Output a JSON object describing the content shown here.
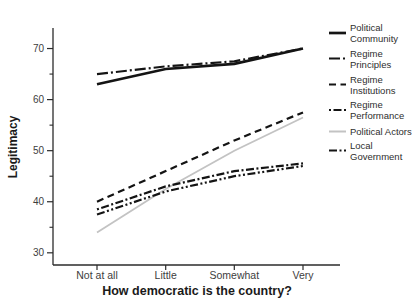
{
  "chart_data": {
    "type": "line",
    "title": "",
    "xlabel": "How democratic is the country?",
    "ylabel": "Legitimacy",
    "categories": [
      "Not at all",
      "Little",
      "Somewhat",
      "Very"
    ],
    "ylim": [
      27.5,
      75
    ],
    "yticks_major": [
      30,
      40,
      50,
      60,
      70
    ],
    "yticks_minor": [
      35,
      45,
      55,
      65,
      75
    ],
    "grid": false,
    "legend_position": "right",
    "axis_color": "#2b2b2b",
    "tick_label_color": "#3d3d3d",
    "legend_text_color": "#2e2e2e",
    "series": [
      {
        "name": "Political Community",
        "label_lines": [
          "Political",
          "Community"
        ],
        "values": [
          63,
          66,
          67,
          70
        ],
        "color": "#141414",
        "dash": "",
        "width": 2.7
      },
      {
        "name": "Regime Principles",
        "label_lines": [
          "Regime",
          "Principles"
        ],
        "values": [
          65,
          66.5,
          67.5,
          70
        ],
        "color": "#141414",
        "dash": "11 3 2 3",
        "width": 2.2
      },
      {
        "name": "Regime Institutions",
        "label_lines": [
          "Regime",
          "Institutions"
        ],
        "values": [
          40,
          46,
          52,
          57.5
        ],
        "color": "#141414",
        "dash": "7 4.5",
        "width": 2.2
      },
      {
        "name": "Regime Performance",
        "label_lines": [
          "Regime",
          "Performance"
        ],
        "values": [
          38.5,
          43,
          46,
          47.5
        ],
        "color": "#141414",
        "dash": "2 2.5 8 2.5",
        "width": 2.2
      },
      {
        "name": "Political Actors",
        "label_lines": [
          "Political Actors"
        ],
        "values": [
          34,
          42.5,
          50,
          56.5
        ],
        "color": "#c3c3c3",
        "dash": "",
        "width": 1.8
      },
      {
        "name": "Local Government",
        "label_lines": [
          "Local",
          "Government"
        ],
        "values": [
          37.5,
          42,
          45,
          47
        ],
        "color": "#141414",
        "dash": "8 2.5 2 2.5 2 2.5",
        "width": 2.2
      }
    ]
  }
}
